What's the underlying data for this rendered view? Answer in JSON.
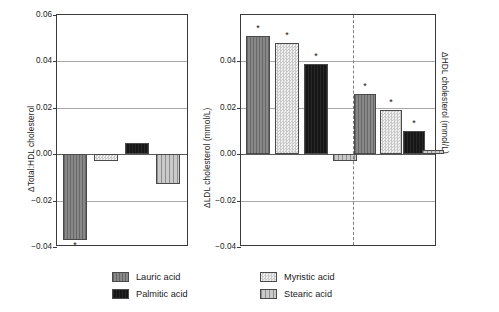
{
  "chart_data": [
    {
      "type": "bar",
      "id": "total-hdl-ratio",
      "title": "",
      "xlabel": "",
      "ylabel": "ΔTotal:HDL cholesterol",
      "ylim": [
        -0.04,
        0.06
      ],
      "yticks": [
        0.06,
        0.04,
        0.02,
        0.0,
        -0.02,
        -0.04
      ],
      "yticklabels": [
        "0.06",
        "0.04",
        "0.02",
        "0.00",
        "−0.02",
        "−0.04"
      ],
      "grid": true,
      "legend_position": "bottom",
      "categories": [
        "Lauric acid",
        "Myristic acid",
        "Palmitic acid",
        "Stearic acid"
      ],
      "values": [
        -0.037,
        -0.003,
        0.005,
        -0.013
      ],
      "significance": [
        "*",
        "",
        "",
        ""
      ]
    },
    {
      "type": "bar",
      "id": "ldl-hdl-cholesterol",
      "title": "",
      "xlabel": "",
      "ylabel": "ΔLDL cholesterol (mmol/L)",
      "ylabel_right": "ΔHDL cholesterol (mmol/L)",
      "ylim": [
        -0.04,
        0.06
      ],
      "yticks": [
        0.04,
        0.02,
        0.0,
        -0.02,
        -0.04
      ],
      "yticklabels": [
        "0.04",
        "0.02",
        "0.00",
        "−0.02",
        "−0.04"
      ],
      "grid": true,
      "divider": true,
      "legend_position": "bottom",
      "groups": [
        "LDL cholesterol",
        "HDL cholesterol"
      ],
      "categories": [
        "Lauric acid",
        "Myristic acid",
        "Palmitic acid",
        "Stearic acid"
      ],
      "series": [
        {
          "name": "LDL cholesterol",
          "values": [
            0.051,
            0.048,
            0.039,
            -0.003
          ],
          "significance": [
            "*",
            "*",
            "*",
            ""
          ]
        },
        {
          "name": "HDL cholesterol",
          "values": [
            0.026,
            0.019,
            0.01,
            0.002
          ],
          "significance": [
            "*",
            "*",
            "*",
            ""
          ]
        }
      ]
    }
  ],
  "legend": {
    "items": [
      {
        "label": "Lauric acid",
        "color": "#7b7b7b",
        "pattern": "vertical-lines"
      },
      {
        "label": "Myristic acid",
        "color": "#dcdcdc",
        "pattern": "checker"
      },
      {
        "label": "Palmitic acid",
        "color": "#1c1c1c",
        "pattern": "solid-dark"
      },
      {
        "label": "Stearic acid",
        "color": "#b0b0b0",
        "pattern": "vertical-stripes"
      }
    ]
  },
  "significance_marker": "*"
}
